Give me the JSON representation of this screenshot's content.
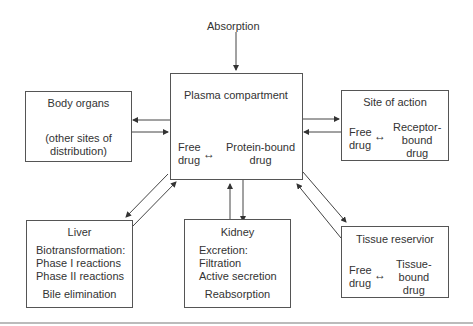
{
  "absorption": "Absorption",
  "plasma": {
    "title": "Plasma compartment",
    "free_drug": [
      "Free",
      "drug"
    ],
    "bound_drug": [
      "Protein-bound",
      "drug"
    ]
  },
  "body_organs": {
    "title": "Body organs",
    "sub": [
      "(other sites of",
      "distribution)"
    ]
  },
  "site_of_action": {
    "title": "Site of action",
    "free_drug": [
      "Free",
      "drug"
    ],
    "bound_drug": [
      "Receptor-",
      "bound",
      "drug"
    ]
  },
  "liver": {
    "title": "Liver",
    "lines": [
      "Biotransformation:",
      "Phase I reactions",
      "Phase II reactions"
    ],
    "footer": "Bile elimination"
  },
  "kidney": {
    "title": "Kidney",
    "lines": [
      "Excretion:",
      "Filtration",
      "Active secretion"
    ],
    "footer": "Reabsorption"
  },
  "tissue_reservoir": {
    "title": "Tissue reservior",
    "free_drug": [
      "Free",
      "drug"
    ],
    "bound_drug": [
      "Tissue-",
      "bound",
      "drug"
    ]
  }
}
